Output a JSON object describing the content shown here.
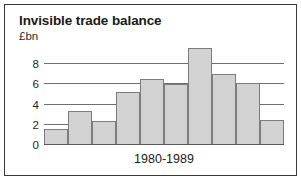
{
  "chart_data": {
    "type": "bar",
    "title": "Invisible trade balance",
    "unit_label": "£bn",
    "xlabel": "1980-1989",
    "ylabel": "£bn",
    "categories": [
      "1980",
      "1981",
      "1982",
      "1983",
      "1984",
      "1985",
      "1986",
      "1987",
      "1988",
      "1989"
    ],
    "values": [
      1.6,
      3.4,
      2.4,
      5.2,
      6.5,
      6.0,
      9.6,
      7.0,
      6.1,
      2.5
    ],
    "ylim": [
      0,
      10
    ],
    "yticks": [
      0,
      2,
      4,
      6,
      8
    ],
    "ytick_labels": [
      "0",
      "2",
      "4",
      "6",
      "8"
    ],
    "grid": true,
    "legend": false,
    "bar_fill": "#d2d2d2",
    "bar_stroke": "#7d7d7d",
    "grid_color": "#6e6e6e",
    "frame_color": "#3a3a3a",
    "background": "#ffffff"
  }
}
